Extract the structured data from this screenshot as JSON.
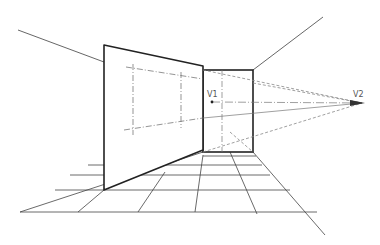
{
  "diagram": {
    "type": "perspective-drawing",
    "labels": {
      "v1": "V1",
      "v2": "V2"
    },
    "colors": {
      "stroke": "#333333",
      "light_stroke": "#666666",
      "dashed_stroke": "#888888",
      "background": "#ffffff"
    },
    "points": {
      "v1": [
        212,
        102
      ],
      "v2": [
        362,
        103
      ]
    }
  }
}
